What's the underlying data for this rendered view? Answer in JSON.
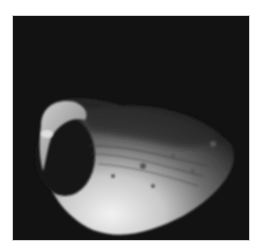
{
  "image": {
    "subject": "Phobos moon with Stickney crater",
    "colors": {
      "background": "#ffffff",
      "space": "#111111",
      "surface_bright": "#e8e8e8",
      "surface_mid": "#8a8a8a",
      "shadow": "#1a1a1a"
    }
  }
}
